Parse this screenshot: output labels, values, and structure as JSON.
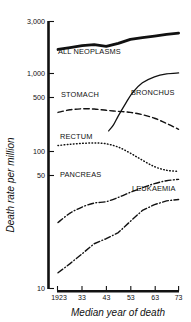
{
  "chart_data": {
    "type": "line",
    "title": "",
    "xlabel": "Median year of death",
    "ylabel": "Death rate per million",
    "yscale": "log",
    "ylim": [
      10,
      3000
    ],
    "xlim": [
      1923,
      1973
    ],
    "grid": false,
    "legend_position": "inline-labels",
    "y_ticks": [
      "3,000",
      "1,000",
      "500",
      "100",
      "50",
      "10"
    ],
    "y_tick_values": [
      3000,
      1000,
      500,
      100,
      50,
      10
    ],
    "x_ticks": [
      "1923",
      "33",
      "43",
      "53",
      "63",
      "73"
    ],
    "x_tick_values": [
      1923,
      1933,
      1943,
      1953,
      1963,
      1973
    ],
    "series": [
      {
        "name": "ALL NEOPLASMS",
        "style": "solid-thick",
        "x": [
          1923,
          1928,
          1933,
          1938,
          1943,
          1948,
          1953,
          1958,
          1963,
          1968,
          1973
        ],
        "values": [
          1650,
          1720,
          1790,
          1830,
          1760,
          1880,
          2050,
          2130,
          2200,
          2280,
          2340
        ]
      },
      {
        "name": "BRONCHUS",
        "style": "solid-thin",
        "x": [
          1944,
          1946,
          1948,
          1951,
          1954,
          1958,
          1963,
          1968,
          1973
        ],
        "values": [
          290,
          330,
          400,
          520,
          660,
          810,
          920,
          980,
          1000
        ]
      },
      {
        "name": "STOMACH",
        "style": "dashed",
        "x": [
          1923,
          1928,
          1933,
          1938,
          1943,
          1948,
          1953,
          1958,
          1963,
          1968,
          1973
        ],
        "values": [
          430,
          455,
          465,
          462,
          450,
          440,
          430,
          410,
          380,
          340,
          300
        ]
      },
      {
        "name": "RECTUM",
        "style": "dotted",
        "x": [
          1923,
          1928,
          1933,
          1938,
          1943,
          1948,
          1953,
          1958,
          1963,
          1968,
          1973
        ],
        "values": [
          212,
          218,
          222,
          224,
          220,
          205,
          180,
          155,
          135,
          125,
          122
        ]
      },
      {
        "name": "PANCREAS",
        "style": "dash-dot",
        "x": [
          1923,
          1928,
          1933,
          1938,
          1943,
          1948,
          1953,
          1958,
          1963,
          1968,
          1973
        ],
        "values": [
          41,
          50,
          57,
          62,
          64,
          70,
          78,
          86,
          94,
          100,
          103
        ]
      },
      {
        "name": "LEUKAEMIA",
        "style": "dash-dot",
        "x": [
          1923,
          1928,
          1933,
          1938,
          1943,
          1948,
          1953,
          1958,
          1963,
          1968,
          1973
        ],
        "values": [
          14,
          17,
          21,
          26,
          29,
          33,
          42,
          53,
          60,
          65,
          67
        ]
      }
    ],
    "annotations": [
      {
        "text": "ALL NEOPLASMS",
        "series": "ALL NEOPLASMS"
      },
      {
        "text": "BRONCHUS",
        "series": "BRONCHUS"
      },
      {
        "text": "STOMACH",
        "series": "STOMACH"
      },
      {
        "text": "RECTUM",
        "series": "RECTUM"
      },
      {
        "text": "PANCREAS",
        "series": "PANCREAS"
      },
      {
        "text": "LEUKAEMIA",
        "series": "LEUKAEMIA"
      }
    ],
    "colors": {
      "line": "#111111",
      "background": "#ffffff"
    }
  }
}
